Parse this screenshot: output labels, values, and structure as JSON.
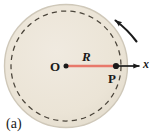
{
  "figure": {
    "caption": "(a)",
    "alt_description": "Rigid disk rotating about center O with radius R to point P on the rim and x-axis reference line",
    "labels": {
      "center": "O",
      "radius": "R",
      "point": "P",
      "axis": "x"
    },
    "colors": {
      "disk_fill": "#ece5d7",
      "disk_edge": "#cfc8b9",
      "dashed_circle": "#4a443a",
      "radius_line": "#e8796b",
      "axis_line": "#1a1a1a",
      "point_dot": "#1a1a1a",
      "rotation_arrow": "#1a1a1a",
      "text": "#1a1a1a",
      "background": "#ffffff"
    },
    "geometry": {
      "center_x": 66,
      "center_y": 66,
      "outer_radius": 62,
      "dashed_radius": 55,
      "radius_line_end_x": 116,
      "axis_arrow_tip_x": 141,
      "rotation_direction": "counterclockwise"
    }
  }
}
